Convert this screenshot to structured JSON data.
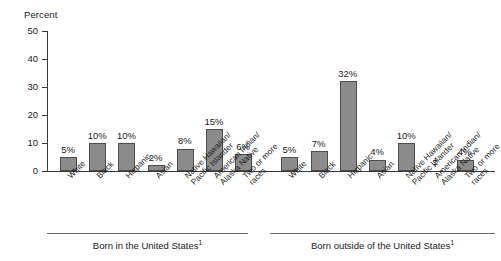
{
  "chart_data": {
    "type": "bar",
    "title": "",
    "xlabel": "",
    "ylabel": "Percent",
    "ylim": [
      0,
      50
    ],
    "yticks": [
      50,
      40,
      30,
      20,
      10,
      0
    ],
    "grid": false,
    "legend": "none",
    "suppressed_marker": "‡",
    "categories": [
      "White",
      "Black",
      "Hispanic",
      "Asian",
      "Native Hawaiian/ Pacific Islander",
      "American Indian/ Alaska Native",
      "Two or more races"
    ],
    "groups": [
      {
        "caption": "Born in the United States",
        "caption_footnote": "1",
        "bars": [
          {
            "category": "White",
            "label_line1": "White",
            "label_line2": "",
            "value": 5,
            "value_label": "5%"
          },
          {
            "category": "Black",
            "label_line1": "Black",
            "label_line2": "",
            "value": 10,
            "value_label": "10%"
          },
          {
            "category": "Hispanic",
            "label_line1": "Hispanic",
            "label_line2": "",
            "value": 10,
            "value_label": "10%"
          },
          {
            "category": "Asian",
            "label_line1": "Asian",
            "label_line2": "",
            "value": 2,
            "value_label": "2%"
          },
          {
            "category": "Native Hawaiian/ Pacific Islander",
            "label_line1": "Native Hawaiian/",
            "label_line2": "Pacific Islander",
            "value": 8,
            "value_label": "8%"
          },
          {
            "category": "American Indian/ Alaska Native",
            "label_line1": "American Indian/",
            "label_line2": "Alaska Native",
            "value": 15,
            "value_label": "15%"
          },
          {
            "category": "Two or more races",
            "label_line1": "Two or more",
            "label_line2": "races",
            "value": 6,
            "value_label": "6%"
          }
        ]
      },
      {
        "caption": "Born outside of the United States",
        "caption_footnote": "1",
        "bars": [
          {
            "category": "White",
            "label_line1": "White",
            "label_line2": "",
            "value": 5,
            "value_label": "5%"
          },
          {
            "category": "Black",
            "label_line1": "Black",
            "label_line2": "",
            "value": 7,
            "value_label": "7%"
          },
          {
            "category": "Hispanic",
            "label_line1": "Hispanic",
            "label_line2": "",
            "value": 32,
            "value_label": "32%"
          },
          {
            "category": "Asian",
            "label_line1": "Asian",
            "label_line2": "",
            "value": 4,
            "value_label": "4%"
          },
          {
            "category": "Native Hawaiian/ Pacific Islander",
            "label_line1": "Native Hawaiian/",
            "label_line2": "Pacific Islander",
            "value": 10,
            "value_label": "10%"
          },
          {
            "category": "American Indian/ Alaska Native",
            "label_line1": "American Indian/",
            "label_line2": "Alaska Native",
            "value": null,
            "value_label": "‡",
            "suppressed": true
          },
          {
            "category": "Two or more races",
            "label_line1": "Two or more",
            "label_line2": "races",
            "value": 4,
            "value_label": "4%"
          }
        ]
      }
    ],
    "colors": {
      "bar_fill": "#8c8c8c",
      "bar_border": "#4d4d4d",
      "axis": "#3a3a3a",
      "text": "#1a1a1a",
      "rule": "#6e6e6e",
      "background": "#ffffff"
    }
  }
}
